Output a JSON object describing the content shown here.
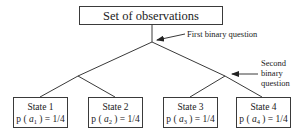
{
  "root": {
    "label": "Set of observations"
  },
  "annotations": {
    "first": "First binary question",
    "second_lines": [
      "Second",
      "binary",
      "question"
    ]
  },
  "states": [
    {
      "label": "State  1",
      "prob_prefix": "p ( ",
      "var": "a",
      "sub": "1",
      "prob_suffix": " ) = 1/4"
    },
    {
      "label": "State  2",
      "prob_prefix": "p ( ",
      "var": "a",
      "sub": "2",
      "prob_suffix": " ) = 1/4"
    },
    {
      "label": "State  3",
      "prob_prefix": "p ( ",
      "var": "a",
      "sub": "3",
      "prob_suffix": " ) = 1/4"
    },
    {
      "label": "State  4",
      "prob_prefix": "p ( ",
      "var": "a",
      "sub": "4",
      "prob_suffix": " ) = 1/4"
    }
  ],
  "colors": {
    "line": "#3a3a3a",
    "text": "#222222",
    "background": "#ffffff"
  }
}
